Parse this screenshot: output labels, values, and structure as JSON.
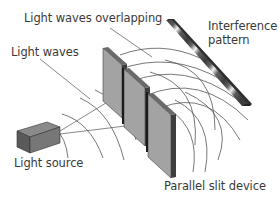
{
  "diagram": {
    "labels": {
      "overlapping": "Light waves overlapping",
      "waves": "Light waves",
      "interference_line1": "Interference",
      "interference_line2": "pattern",
      "source": "Light source",
      "slit_device": "Parallel slit device"
    },
    "colors": {
      "text": "#3a3a3a",
      "line": "#555555",
      "panel_face": "#9a9a9a",
      "panel_edge": "#4a4a4a",
      "pattern_dark": "#3c3c3c",
      "pattern_light": "#f0f0f0"
    }
  }
}
